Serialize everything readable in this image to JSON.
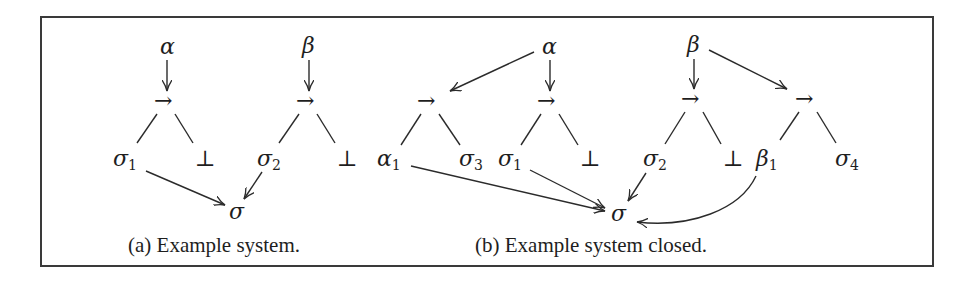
{
  "figure": {
    "panels": [
      {
        "id": "a",
        "caption": "(a) Example system.",
        "nodes": [
          {
            "id": "alpha",
            "label": "α",
            "sub": ""
          },
          {
            "id": "arrow1",
            "label": "→",
            "sub": ""
          },
          {
            "id": "sigma1",
            "label": "σ",
            "sub": "1"
          },
          {
            "id": "bot1",
            "label": "⊥",
            "sub": ""
          },
          {
            "id": "beta",
            "label": "β",
            "sub": ""
          },
          {
            "id": "arrow2",
            "label": "→",
            "sub": ""
          },
          {
            "id": "sigma2",
            "label": "σ",
            "sub": "2"
          },
          {
            "id": "bot2",
            "label": "⊥",
            "sub": ""
          },
          {
            "id": "sigma",
            "label": "σ",
            "sub": ""
          }
        ],
        "edges": [
          {
            "from": "alpha",
            "to": "arrow1",
            "directed": true
          },
          {
            "from": "arrow1",
            "to": "sigma1",
            "directed": false
          },
          {
            "from": "arrow1",
            "to": "bot1",
            "directed": false
          },
          {
            "from": "beta",
            "to": "arrow2",
            "directed": true
          },
          {
            "from": "arrow2",
            "to": "sigma2",
            "directed": false
          },
          {
            "from": "arrow2",
            "to": "bot2",
            "directed": false
          },
          {
            "from": "sigma1",
            "to": "sigma",
            "directed": true
          },
          {
            "from": "sigma2",
            "to": "sigma",
            "directed": true
          }
        ]
      },
      {
        "id": "b",
        "caption": "(b) Example system closed.",
        "nodes": [
          {
            "id": "alpha",
            "label": "α",
            "sub": ""
          },
          {
            "id": "arrowA",
            "label": "→",
            "sub": ""
          },
          {
            "id": "alpha1",
            "label": "α",
            "sub": "1"
          },
          {
            "id": "sigma3",
            "label": "σ",
            "sub": "3"
          },
          {
            "id": "arrow1",
            "label": "→",
            "sub": ""
          },
          {
            "id": "sigma1",
            "label": "σ",
            "sub": "1"
          },
          {
            "id": "bot1",
            "label": "⊥",
            "sub": ""
          },
          {
            "id": "beta",
            "label": "β",
            "sub": ""
          },
          {
            "id": "arrow2",
            "label": "→",
            "sub": ""
          },
          {
            "id": "sigma2",
            "label": "σ",
            "sub": "2"
          },
          {
            "id": "bot2",
            "label": "⊥",
            "sub": ""
          },
          {
            "id": "arrowB",
            "label": "→",
            "sub": ""
          },
          {
            "id": "beta1",
            "label": "β",
            "sub": "1"
          },
          {
            "id": "sigma4",
            "label": "σ",
            "sub": "4"
          },
          {
            "id": "sigma",
            "label": "σ",
            "sub": ""
          }
        ],
        "edges": [
          {
            "from": "alpha",
            "to": "arrowA",
            "directed": true
          },
          {
            "from": "alpha",
            "to": "arrow1",
            "directed": true
          },
          {
            "from": "arrowA",
            "to": "alpha1",
            "directed": false
          },
          {
            "from": "arrowA",
            "to": "sigma3",
            "directed": false
          },
          {
            "from": "arrow1",
            "to": "sigma1",
            "directed": false
          },
          {
            "from": "arrow1",
            "to": "bot1",
            "directed": false
          },
          {
            "from": "beta",
            "to": "arrow2",
            "directed": true
          },
          {
            "from": "beta",
            "to": "arrowB",
            "directed": true
          },
          {
            "from": "arrow2",
            "to": "sigma2",
            "directed": false
          },
          {
            "from": "arrow2",
            "to": "bot2",
            "directed": false
          },
          {
            "from": "arrowB",
            "to": "beta1",
            "directed": false
          },
          {
            "from": "arrowB",
            "to": "sigma4",
            "directed": false
          },
          {
            "from": "alpha1",
            "to": "sigma",
            "directed": true
          },
          {
            "from": "sigma1",
            "to": "sigma",
            "directed": true
          },
          {
            "from": "sigma2",
            "to": "sigma",
            "directed": true
          },
          {
            "from": "beta1",
            "to": "sigma",
            "directed": true,
            "curved": true
          }
        ]
      }
    ]
  }
}
